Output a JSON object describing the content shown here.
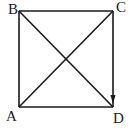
{
  "diagram": {
    "type": "geometry-square-with-diagonals",
    "vertices": [
      {
        "label": "B",
        "x": 19,
        "y": 11
      },
      {
        "label": "C",
        "x": 113,
        "y": 11
      },
      {
        "label": "D",
        "x": 113,
        "y": 107
      },
      {
        "label": "A",
        "x": 19,
        "y": 107
      }
    ],
    "edges": [
      "AB",
      "BC",
      "CD",
      "DA"
    ],
    "diagonals": [
      "AC",
      "BD"
    ],
    "arrow": {
      "from": "C",
      "to": "D"
    },
    "colors": {
      "stroke": "#1a1a1a",
      "background": "#ffffff"
    }
  },
  "labels": {
    "a": "A",
    "b": "B",
    "c": "C",
    "d": "D"
  }
}
